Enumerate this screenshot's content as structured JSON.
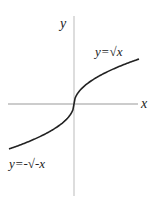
{
  "chart_data": {
    "type": "line",
    "title": "",
    "xlabel": "x",
    "ylabel": "y",
    "grid": false,
    "xlim": [
      -1,
      1
    ],
    "ylim": [
      -1,
      1
    ],
    "series": [
      {
        "name": "y=√x",
        "function": "sqrt(x)",
        "domain": [
          0,
          1
        ]
      },
      {
        "name": "y=-√-x",
        "function": "-sqrt(-x)",
        "domain": [
          -1,
          0
        ]
      }
    ],
    "annotations": [
      {
        "text": "y=√x",
        "near": "upper-right branch"
      },
      {
        "text": "y=-√-x",
        "near": "lower-left branch"
      }
    ],
    "colors": {
      "curve": "#222222",
      "axis": "#aaaaaa"
    }
  }
}
